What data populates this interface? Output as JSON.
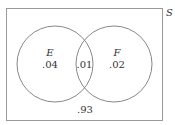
{
  "diagram": {
    "type": "venn",
    "universe_label": "S",
    "sets": [
      {
        "name": "E",
        "only_value": ".04"
      },
      {
        "name": "F",
        "only_value": ".02"
      }
    ],
    "intersection_value": ".01",
    "outside_value": ".93",
    "colors": {
      "stroke": "#888888",
      "text": "#333333",
      "background": "#ffffff"
    }
  }
}
